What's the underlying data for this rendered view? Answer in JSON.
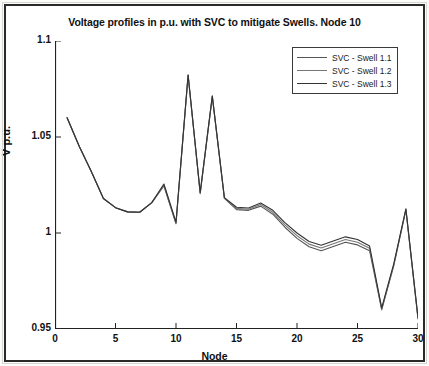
{
  "chart_data": {
    "type": "line",
    "title": "Voltage profiles in p.u. with SVC to mitigate Swells. Node 10",
    "xlabel": "Node",
    "ylabel": "V p.u.",
    "xlim": [
      0,
      30
    ],
    "ylim": [
      0.95,
      1.1
    ],
    "xticks": [
      0,
      5,
      10,
      15,
      20,
      25,
      30
    ],
    "yticks": [
      0.95,
      1,
      1.05,
      1.1
    ],
    "xtick_labels": [
      "0",
      "5",
      "10",
      "15",
      "20",
      "25",
      "30"
    ],
    "ytick_labels": [
      "0.95",
      "1",
      "1.05",
      "1.1"
    ],
    "grid": false,
    "legend_position": "upper right",
    "x": [
      1,
      2,
      3,
      4,
      5,
      6,
      7,
      8,
      9,
      10,
      11,
      12,
      13,
      14,
      15,
      16,
      17,
      18,
      19,
      20,
      21,
      22,
      23,
      24,
      25,
      26,
      27,
      28,
      29,
      30
    ],
    "series": [
      {
        "name": "SVC - Swell 1.1",
        "color": "#555555",
        "values": [
          1.06,
          1.0452,
          1.032,
          1.018,
          1.0132,
          1.011,
          1.0108,
          1.0158,
          1.0245,
          1.0048,
          1.082,
          1.0205,
          1.071,
          1.018,
          1.0122,
          1.0118,
          1.014,
          1.0098,
          1.003,
          0.9972,
          0.9928,
          0.9908,
          0.993,
          0.9952,
          0.9938,
          0.9908,
          0.96,
          0.983,
          1.012,
          0.9552
        ]
      },
      {
        "name": "SVC - Swell 1.2",
        "color": "#777777",
        "values": [
          1.06,
          1.0452,
          1.032,
          1.018,
          1.0132,
          1.011,
          1.0108,
          1.0158,
          1.025,
          1.0052,
          1.0822,
          1.0208,
          1.0712,
          1.0182,
          1.0128,
          1.0124,
          1.0148,
          1.0108,
          1.0042,
          0.9986,
          0.9942,
          0.9922,
          0.9944,
          0.9966,
          0.9952,
          0.992,
          0.9605,
          0.9835,
          1.0123,
          0.9556
        ]
      },
      {
        "name": "SVC - Swell 1.3",
        "color": "#333333",
        "values": [
          1.06,
          1.0452,
          1.032,
          1.018,
          1.0132,
          1.011,
          1.0108,
          1.0158,
          1.0255,
          1.0056,
          1.0824,
          1.0211,
          1.0714,
          1.0184,
          1.0134,
          1.013,
          1.0156,
          1.0118,
          1.0054,
          1.0,
          0.9956,
          0.9936,
          0.9958,
          0.998,
          0.9966,
          0.9932,
          0.961,
          0.984,
          1.0126,
          0.956
        ]
      }
    ]
  }
}
